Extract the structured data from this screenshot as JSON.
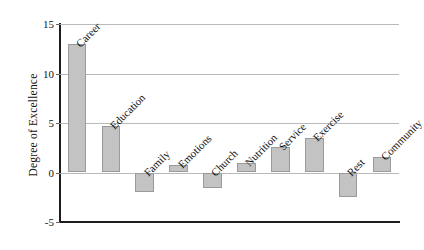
{
  "chart_data": {
    "type": "bar",
    "title": "",
    "xlabel": "",
    "ylabel": "Degree of Excellence",
    "ylim": [
      -5,
      15
    ],
    "yticks": [
      -5,
      0,
      5,
      10,
      15
    ],
    "ytick_labels": [
      "-5",
      "0",
      "5",
      "10",
      "15"
    ],
    "grid": true,
    "legend": "none",
    "bar_color": "#c3c3c3",
    "bar_edge_color": "#9a9a9a",
    "axis_color": "#1d1d1d",
    "gridline_color": "#b9b9b9",
    "categories": [
      "Career",
      "Education",
      "Family",
      "Emotions",
      "Church",
      "Nutrition",
      "Service",
      "Exercise",
      "Rest",
      "Community"
    ],
    "values": [
      13,
      4.7,
      -2,
      0.8,
      -1.6,
      1,
      2.6,
      3.5,
      -2.5,
      1.6
    ]
  }
}
